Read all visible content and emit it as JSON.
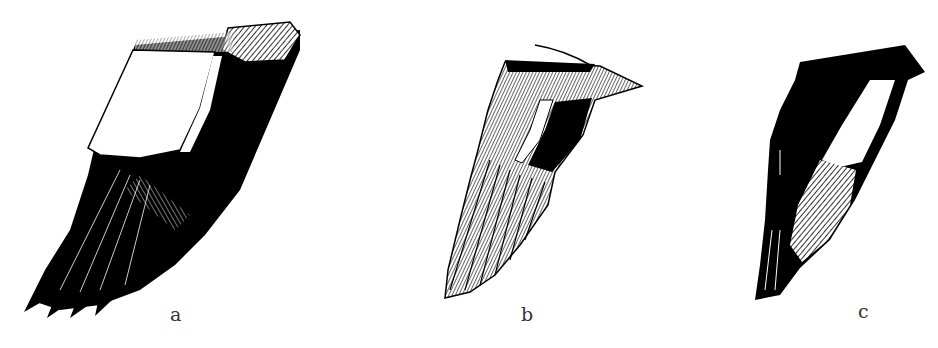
{
  "figure": {
    "background": "#ffffff",
    "ink_color": "#000000",
    "panels": [
      {
        "id": "a",
        "label": "a",
        "description": "Wing with large white secondary patch and black primaries"
      },
      {
        "id": "b",
        "label": "b",
        "description": "Finely hatched wing with black inner secondaries"
      },
      {
        "id": "c",
        "label": "c",
        "description": "Mostly black wing with hatched white bar on primaries"
      }
    ]
  }
}
